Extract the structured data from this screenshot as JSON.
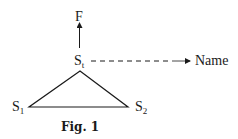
{
  "figure": {
    "caption": "Fig. 1",
    "nodes": {
      "top": {
        "label": "F"
      },
      "center": {
        "label": "S",
        "subscript": "t"
      },
      "left": {
        "label": "S",
        "subscript": "1"
      },
      "right": {
        "label": "S",
        "subscript": "2"
      },
      "name": {
        "label": "Name"
      }
    },
    "edges": [
      {
        "from": "center",
        "to": "top",
        "style": "solid-arrow"
      },
      {
        "from": "center",
        "to": "name",
        "style": "dashed-arrow"
      },
      {
        "from": "center",
        "to": "left",
        "style": "solid"
      },
      {
        "from": "center",
        "to": "right",
        "style": "solid"
      },
      {
        "from": "left",
        "to": "right",
        "style": "solid"
      }
    ]
  }
}
